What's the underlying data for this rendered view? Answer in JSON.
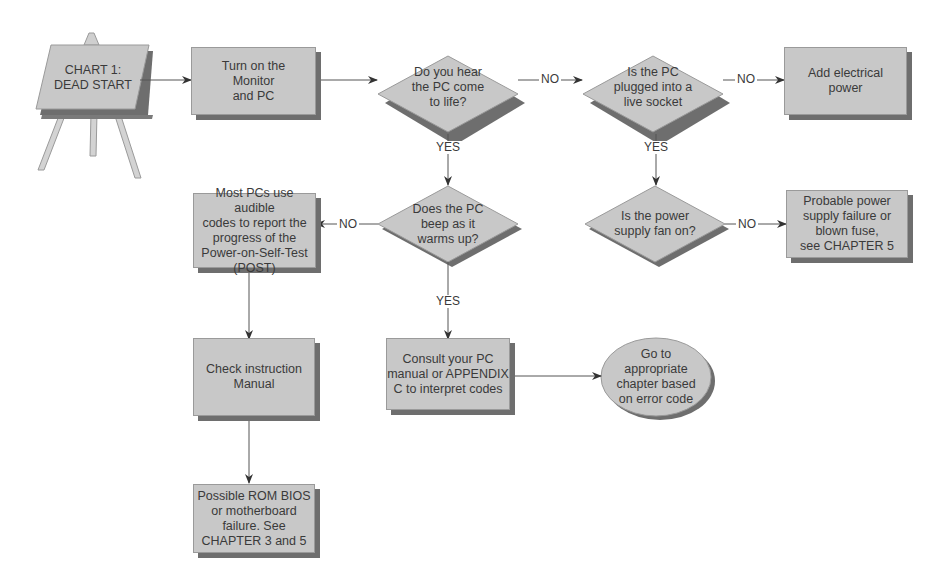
{
  "diagram": {
    "title": "CHART 1:\nDEAD START",
    "colors": {
      "node_fill": "#c8c8c8",
      "node_shadow": "#6e6e6e",
      "line": "#555555",
      "text": "#3a3a3a"
    },
    "nodes": {
      "start": {
        "type": "easel",
        "label": "CHART 1:\nDEAD START"
      },
      "turn_on": {
        "type": "process",
        "label": "Turn on the\nMonitor\nand PC"
      },
      "hear_life": {
        "type": "decision",
        "label": "Do you hear\nthe PC come\nto life?"
      },
      "plugged_in": {
        "type": "decision",
        "label": "Is the PC\nplugged into a\nlive socket"
      },
      "add_power": {
        "type": "process",
        "label": "Add electrical\npower"
      },
      "beep": {
        "type": "decision",
        "label": "Does the PC\nbeep as it\nwarms up?"
      },
      "post_codes": {
        "type": "process",
        "label": "Most PCs use audible\ncodes to report the\nprogress of the\nPower-on-Self-Test\n(POST)"
      },
      "fan_on": {
        "type": "decision",
        "label": "Is the power\nsupply fan on?"
      },
      "psu_failure": {
        "type": "process",
        "label": "Probable power\nsupply failure or\nblown fuse,\nsee CHAPTER 5"
      },
      "check_manual": {
        "type": "process",
        "label": "Check instruction\nManual"
      },
      "consult_manual": {
        "type": "process",
        "label": "Consult your PC\nmanual or APPENDIX\nC to interpret codes"
      },
      "go_chapter": {
        "type": "terminal",
        "label": "Go to\nappropriate\nchapter based\non error code"
      },
      "rom_bios": {
        "type": "process",
        "label": "Possible ROM BIOS\nor motherboard\nfailure. See\nCHAPTER 3 and 5"
      }
    },
    "edges": [
      {
        "from": "start",
        "to": "turn_on",
        "label": ""
      },
      {
        "from": "turn_on",
        "to": "hear_life",
        "label": ""
      },
      {
        "from": "hear_life",
        "to": "plugged_in",
        "label": "NO"
      },
      {
        "from": "plugged_in",
        "to": "add_power",
        "label": "NO"
      },
      {
        "from": "hear_life",
        "to": "beep",
        "label": "YES"
      },
      {
        "from": "plugged_in",
        "to": "fan_on",
        "label": "YES"
      },
      {
        "from": "beep",
        "to": "post_codes",
        "label": "NO"
      },
      {
        "from": "fan_on",
        "to": "psu_failure",
        "label": "NO"
      },
      {
        "from": "beep",
        "to": "consult_manual",
        "label": "YES"
      },
      {
        "from": "post_codes",
        "to": "check_manual",
        "label": ""
      },
      {
        "from": "consult_manual",
        "to": "go_chapter",
        "label": ""
      },
      {
        "from": "check_manual",
        "to": "rom_bios",
        "label": ""
      }
    ],
    "edge_labels": {
      "no": "NO",
      "yes": "YES"
    }
  }
}
